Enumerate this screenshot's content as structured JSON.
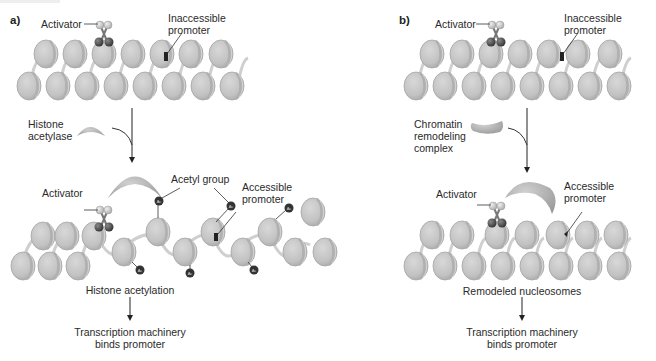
{
  "figure": {
    "panels": [
      {
        "id": "a",
        "label": "a)",
        "top": {
          "activator": "Activator",
          "inaccessible_promoter": [
            "Inaccessible",
            "promoter"
          ]
        },
        "enzyme": [
          "Histone",
          "acetylase"
        ],
        "bottom": {
          "activator": "Activator",
          "acetyl_group": "Acetyl group",
          "accessible_promoter": [
            "Accessible",
            "promoter"
          ],
          "acetyl_tag": "Ac"
        },
        "result": "Histone acetylation",
        "outcome": [
          "Transcription machinery",
          "binds promoter"
        ]
      },
      {
        "id": "b",
        "label": "b)",
        "top": {
          "activator": "Activator",
          "inaccessible_promoter": [
            "Inaccessible",
            "promoter"
          ]
        },
        "enzyme": [
          "Chromatin",
          "remodeling",
          "complex"
        ],
        "bottom": {
          "activator": "Activator",
          "accessible_promoter": [
            "Accessible",
            "promoter"
          ]
        },
        "result": "Remodeled nucleosomes",
        "outcome": [
          "Transcription machinery",
          "binds promoter"
        ]
      }
    ],
    "colors": {
      "nucleosome": "#c4c4c4",
      "nucleosome_edge": "#9a9a9a",
      "enzyme": "#b0b0b0",
      "promoter": "#2a2a2a",
      "acetyl": "#3a3a3a",
      "text": "#2a2a2a"
    }
  }
}
